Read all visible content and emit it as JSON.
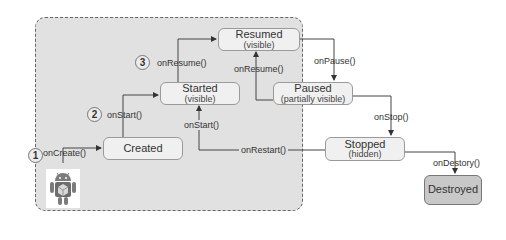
{
  "diagram": {
    "states": [
      {
        "id": "created",
        "name": "Created",
        "sub": ""
      },
      {
        "id": "started",
        "name": "Started",
        "sub": "(visible)"
      },
      {
        "id": "resumed",
        "name": "Resumed",
        "sub": "(visible)"
      },
      {
        "id": "paused",
        "name": "Paused",
        "sub": "(partially visible)"
      },
      {
        "id": "stopped",
        "name": "Stopped",
        "sub": "(hidden)"
      },
      {
        "id": "destroyed",
        "name": "Destroyed",
        "sub": ""
      }
    ],
    "transitions": [
      {
        "label": "onCreate()",
        "from": "start",
        "to": "created",
        "step": "1"
      },
      {
        "label": "onStart()",
        "from": "created",
        "to": "started",
        "step": "2"
      },
      {
        "label": "onResume()",
        "from": "started",
        "to": "resumed",
        "step": "3"
      },
      {
        "label": "onPause()",
        "from": "resumed",
        "to": "paused"
      },
      {
        "label": "onResume()",
        "from": "paused",
        "to": "resumed"
      },
      {
        "label": "onStop()",
        "from": "paused",
        "to": "stopped"
      },
      {
        "label": "onRestart()",
        "from": "stopped",
        "to": "started"
      },
      {
        "label": "onStart()",
        "from": "stopped",
        "to": "started"
      },
      {
        "label": "onDestory()",
        "from": "stopped",
        "to": "destroyed"
      }
    ],
    "steps": [
      "1",
      "2",
      "3"
    ],
    "icon": "android-robot-icon",
    "colors": {
      "group_fill": "#e1e1e1",
      "state_fill": "#f0f0f0",
      "destroyed_fill": "#c8c8c8",
      "border": "#9a9a9a",
      "line": "#333333"
    }
  }
}
